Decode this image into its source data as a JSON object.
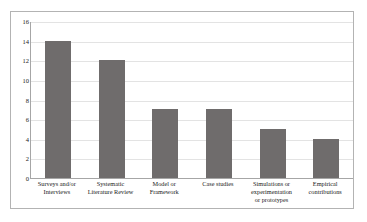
{
  "chart_data": {
    "type": "bar",
    "title": "",
    "subtitle": "",
    "xlabel": "",
    "ylabel": "",
    "ylim": [
      0,
      16
    ],
    "y_tick_step": 2,
    "grid": true,
    "legend": false,
    "legend_position": "none",
    "bar_color": "#6f6c6c",
    "gridline_color": "#e3e3e3",
    "axis_color": "#a6a6a6",
    "border_color": "#b3b3b3",
    "background_color": "#ffffff",
    "categories": [
      "Surveys and/or Interviews",
      "Systematic Literature Review",
      "Model or Framework",
      "Case studies",
      "Simulations or experimentation or prototypes",
      "Empirical contributions"
    ],
    "values": [
      14,
      12,
      7,
      7,
      5,
      4
    ],
    "y_ticks": [
      16,
      14,
      12,
      10,
      8,
      6,
      4,
      2,
      0
    ],
    "y_tick_labels": [
      "16",
      "14",
      "12",
      "10",
      "8",
      "6",
      "4",
      "2",
      "0"
    ],
    "category_lines": [
      [
        "Surveys and/or",
        "Interviews"
      ],
      [
        "Systematic",
        "Literature Review"
      ],
      [
        "Model or",
        "Framework"
      ],
      [
        "Case studies"
      ],
      [
        "Simulations or",
        "experimentation",
        "or prototypes"
      ],
      [
        "Empirical",
        "contributions"
      ]
    ]
  }
}
